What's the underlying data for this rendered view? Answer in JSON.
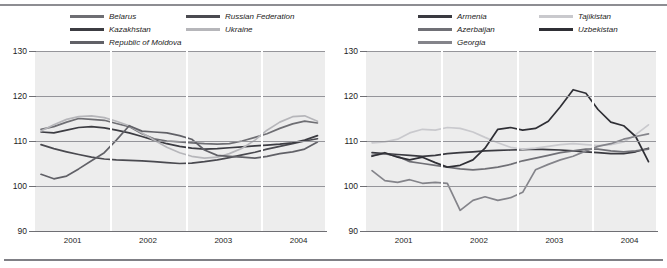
{
  "chart_data": [
    {
      "id": "left",
      "type": "line",
      "title": "",
      "xlabel": "",
      "ylabel": "",
      "ylim": [
        90,
        130
      ],
      "yticks": [
        90,
        100,
        110,
        120,
        130
      ],
      "xlim": [
        2000.5,
        2004.35
      ],
      "xticks": [
        2001,
        2002,
        2003,
        2004
      ],
      "xtick_labels": [
        "2001",
        "2002",
        "2003",
        "2004"
      ],
      "grid": true,
      "legend_position": "above",
      "series": [
        {
          "name": "Belarus",
          "color": "#6e6e73",
          "x": [
            2000.58,
            2000.75,
            2000.92,
            2001.08,
            2001.25,
            2001.42,
            2001.58,
            2001.75,
            2001.92,
            2002.08,
            2002.25,
            2002.42,
            2002.58,
            2002.75,
            2002.92,
            2003.08,
            2003.25,
            2003.42,
            2003.58,
            2003.75,
            2003.92,
            2004.08,
            2004.25
          ],
          "values": [
            112.6,
            113.2,
            114.2,
            115.0,
            114.8,
            114.6,
            113.9,
            113.2,
            111.6,
            110.5,
            110.0,
            109.8,
            109.6,
            109.4,
            109.3,
            109.4,
            110.0,
            110.8,
            111.6,
            112.8,
            113.8,
            114.4,
            114.0
          ]
        },
        {
          "name": "Russian Federation",
          "color": "#4a4a50",
          "x": [
            2000.58,
            2000.75,
            2000.92,
            2001.08,
            2001.25,
            2001.42,
            2001.58,
            2001.75,
            2001.92,
            2002.08,
            2002.25,
            2002.42,
            2002.58,
            2002.75,
            2002.92,
            2003.08,
            2003.25,
            2003.42,
            2003.58,
            2003.75,
            2003.92,
            2004.08,
            2004.25
          ],
          "values": [
            109.2,
            108.3,
            107.6,
            107.0,
            106.4,
            106.0,
            105.8,
            105.7,
            105.6,
            105.4,
            105.2,
            105.0,
            105.1,
            105.4,
            105.8,
            106.3,
            106.9,
            107.5,
            108.2,
            108.8,
            109.4,
            110.0,
            110.5
          ]
        },
        {
          "name": "Kazakhstan",
          "color": "#3c3c42",
          "x": [
            2000.58,
            2000.75,
            2000.92,
            2001.08,
            2001.25,
            2001.42,
            2001.58,
            2001.75,
            2001.92,
            2002.08,
            2002.25,
            2002.42,
            2002.58,
            2002.75,
            2002.92,
            2003.08,
            2003.25,
            2003.42,
            2003.58,
            2003.75,
            2003.92,
            2004.08,
            2004.25
          ],
          "values": [
            112.0,
            111.8,
            112.4,
            113.0,
            113.2,
            112.9,
            112.4,
            111.8,
            111.0,
            110.2,
            109.4,
            108.8,
            108.4,
            108.2,
            108.3,
            108.5,
            108.7,
            108.9,
            109.1,
            109.3,
            109.6,
            110.2,
            111.2
          ]
        },
        {
          "name": "Ukraine",
          "color": "#b6b6ba",
          "x": [
            2000.58,
            2000.75,
            2000.92,
            2001.08,
            2001.25,
            2001.42,
            2001.58,
            2001.75,
            2001.92,
            2002.08,
            2002.25,
            2002.42,
            2002.58,
            2002.75,
            2002.92,
            2003.08,
            2003.25,
            2003.42,
            2003.58,
            2003.75,
            2003.92,
            2004.08,
            2004.25
          ],
          "values": [
            112.2,
            113.6,
            114.8,
            115.4,
            115.6,
            115.2,
            114.4,
            113.4,
            111.8,
            110.2,
            108.6,
            107.4,
            106.6,
            106.2,
            106.4,
            107.2,
            108.4,
            110.2,
            112.4,
            114.2,
            115.4,
            115.6,
            114.4
          ]
        },
        {
          "name": "Republic of Moldova",
          "color": "#616167",
          "x": [
            2000.58,
            2000.75,
            2000.92,
            2001.08,
            2001.25,
            2001.42,
            2001.58,
            2001.75,
            2001.92,
            2002.08,
            2002.25,
            2002.42,
            2002.58,
            2002.75,
            2002.92,
            2003.08,
            2003.25,
            2003.42,
            2003.58,
            2003.75,
            2003.92,
            2004.08,
            2004.25
          ],
          "values": [
            102.6,
            101.6,
            102.2,
            103.8,
            105.6,
            107.4,
            110.2,
            113.4,
            112.2,
            112.0,
            111.8,
            111.2,
            110.4,
            108.0,
            106.8,
            106.6,
            106.4,
            106.2,
            106.6,
            107.2,
            107.6,
            108.2,
            109.8
          ]
        }
      ]
    },
    {
      "id": "right",
      "type": "line",
      "title": "",
      "xlabel": "",
      "ylabel": "",
      "ylim": [
        90,
        130
      ],
      "yticks": [
        90,
        100,
        110,
        120,
        130
      ],
      "xlim": [
        2000.5,
        2004.35
      ],
      "xticks": [
        2001,
        2002,
        2003,
        2004
      ],
      "xtick_labels": [
        "2001",
        "2002",
        "2003",
        "2004"
      ],
      "grid": true,
      "legend_position": "above",
      "series": [
        {
          "name": "Armenia",
          "color": "#3a3a40",
          "x": [
            2000.58,
            2000.75,
            2000.92,
            2001.08,
            2001.25,
            2001.42,
            2001.58,
            2001.75,
            2001.92,
            2002.08,
            2002.25,
            2002.42,
            2002.58,
            2002.75,
            2002.92,
            2003.08,
            2003.25,
            2003.42,
            2003.58,
            2003.75,
            2003.92,
            2004.08,
            2004.25
          ],
          "values": [
            107.4,
            107.2,
            107.0,
            106.8,
            106.6,
            106.8,
            107.2,
            107.4,
            107.6,
            107.8,
            107.9,
            108.0,
            108.1,
            108.2,
            108.1,
            108.0,
            107.8,
            107.6,
            107.4,
            107.2,
            107.2,
            107.6,
            108.4
          ]
        },
        {
          "name": "Tajikistan",
          "color": "#c9c9cd",
          "x": [
            2000.58,
            2000.75,
            2000.92,
            2001.08,
            2001.25,
            2001.42,
            2001.58,
            2001.75,
            2001.92,
            2002.08,
            2002.25,
            2002.42,
            2002.58,
            2002.75,
            2002.92,
            2003.08,
            2003.25,
            2003.42,
            2003.58,
            2003.75,
            2003.92,
            2004.08,
            2004.25
          ],
          "values": [
            109.6,
            109.8,
            110.4,
            111.8,
            112.6,
            112.4,
            113.0,
            112.8,
            112.0,
            110.8,
            109.6,
            108.6,
            108.2,
            108.4,
            108.8,
            109.2,
            109.4,
            109.2,
            109.0,
            109.2,
            109.8,
            111.4,
            113.6
          ]
        },
        {
          "name": "Azerbaijan",
          "color": "#707076",
          "x": [
            2000.58,
            2000.75,
            2000.92,
            2001.08,
            2001.25,
            2001.42,
            2001.58,
            2001.75,
            2001.92,
            2002.08,
            2002.25,
            2002.42,
            2002.58,
            2002.75,
            2002.92,
            2003.08,
            2003.25,
            2003.42,
            2003.58,
            2003.75,
            2003.92,
            2004.08,
            2004.25
          ],
          "values": [
            106.8,
            107.2,
            106.6,
            105.4,
            105.0,
            104.6,
            104.2,
            103.8,
            103.6,
            103.8,
            104.2,
            104.8,
            105.6,
            106.2,
            106.8,
            107.4,
            107.8,
            108.2,
            108.2,
            107.8,
            107.6,
            107.8,
            108.2
          ]
        },
        {
          "name": "Uzbekistan",
          "color": "#2f2f35",
          "x": [
            2000.58,
            2000.75,
            2000.92,
            2001.08,
            2001.25,
            2001.42,
            2001.58,
            2001.75,
            2001.92,
            2002.08,
            2002.25,
            2002.42,
            2002.58,
            2002.75,
            2002.92,
            2003.08,
            2003.25,
            2003.42,
            2003.58,
            2003.75,
            2003.92,
            2004.08,
            2004.25
          ],
          "values": [
            106.6,
            107.4,
            106.4,
            105.8,
            106.4,
            105.2,
            104.2,
            104.6,
            105.8,
            108.4,
            112.6,
            113.0,
            112.4,
            112.8,
            114.4,
            117.6,
            121.4,
            120.6,
            117.0,
            114.2,
            113.4,
            111.0,
            105.4
          ]
        },
        {
          "name": "Georgia",
          "color": "#84848a",
          "x": [
            2000.58,
            2000.75,
            2000.92,
            2001.08,
            2001.25,
            2001.42,
            2001.58,
            2001.75,
            2001.92,
            2002.08,
            2002.25,
            2002.42,
            2002.58,
            2002.75,
            2002.92,
            2003.08,
            2003.25,
            2003.42,
            2003.58,
            2003.75,
            2003.92,
            2004.08,
            2004.25
          ],
          "values": [
            103.4,
            101.2,
            100.8,
            101.4,
            100.6,
            100.8,
            100.6,
            94.6,
            96.8,
            97.6,
            96.8,
            97.4,
            98.6,
            103.6,
            104.8,
            105.8,
            106.6,
            107.8,
            108.8,
            109.4,
            110.4,
            111.0,
            111.6
          ]
        }
      ]
    }
  ]
}
